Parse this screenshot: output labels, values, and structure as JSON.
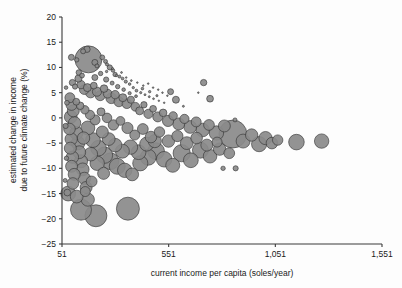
{
  "figure": {
    "name": "bubble-scatter-income-climate",
    "background_color": "#fdfdfd",
    "bubble_fill": "#8a8a8a",
    "bubble_stroke": "#2f2f2f"
  },
  "chart_data": {
    "type": "scatter",
    "title": "",
    "subtitle": "",
    "xlabel": "current income per capita (soles/year)",
    "ylabel": "estimated change in income\ndue to future climate change (%)",
    "ylabel_line1": "estimated change in income",
    "ylabel_line2": "due to future  climate change (%)",
    "xlim": [
      51,
      1551
    ],
    "ylim": [
      -25,
      20
    ],
    "grid": false,
    "legend": null,
    "xticks": [
      51,
      551,
      1051,
      1551
    ],
    "xticklabels": [
      "51",
      "551",
      "1,051",
      "1,551"
    ],
    "yticks": [
      20,
      15,
      10,
      5,
      0,
      -5,
      -10,
      -15,
      -20,
      -25
    ],
    "yticklabels": [
      "20",
      "15",
      "10",
      "5",
      "0",
      "−5",
      "−10",
      "−15",
      "−20",
      "−25"
    ],
    "marker": "circle",
    "size_encoding": "bubble area proportional to population",
    "points": [
      {
        "x": 95,
        "y": 12.0,
        "s": 3.0
      },
      {
        "x": 120,
        "y": 11.5,
        "s": 2.2
      },
      {
        "x": 150,
        "y": 13.2,
        "s": 2.5
      },
      {
        "x": 168,
        "y": 13.6,
        "s": 3.2
      },
      {
        "x": 175,
        "y": 11.6,
        "s": 13.5
      },
      {
        "x": 205,
        "y": 11.0,
        "s": 3.0
      },
      {
        "x": 215,
        "y": 10.3,
        "s": 2.0
      },
      {
        "x": 240,
        "y": 12.0,
        "s": 2.4
      },
      {
        "x": 255,
        "y": 11.2,
        "s": 2.0
      },
      {
        "x": 262,
        "y": 10.6,
        "s": 1.6
      },
      {
        "x": 275,
        "y": 10.0,
        "s": 2.6
      },
      {
        "x": 290,
        "y": 9.4,
        "s": 1.8
      },
      {
        "x": 300,
        "y": 8.6,
        "s": 2.2
      },
      {
        "x": 320,
        "y": 8.2,
        "s": 1.5
      },
      {
        "x": 335,
        "y": 7.8,
        "s": 1.4
      },
      {
        "x": 350,
        "y": 7.2,
        "s": 1.6
      },
      {
        "x": 368,
        "y": 6.7,
        "s": 1.3
      },
      {
        "x": 385,
        "y": 6.0,
        "s": 1.2
      },
      {
        "x": 400,
        "y": 5.4,
        "s": 1.4
      },
      {
        "x": 420,
        "y": 5.0,
        "s": 1.1
      },
      {
        "x": 440,
        "y": 4.6,
        "s": 1.0
      },
      {
        "x": 460,
        "y": 4.2,
        "s": 1.0
      },
      {
        "x": 480,
        "y": 3.8,
        "s": 0.9
      },
      {
        "x": 505,
        "y": 3.4,
        "s": 0.8
      },
      {
        "x": 530,
        "y": 3.0,
        "s": 0.8
      },
      {
        "x": 560,
        "y": 5.2,
        "s": 3.0
      },
      {
        "x": 585,
        "y": 3.6,
        "s": 3.5
      },
      {
        "x": 620,
        "y": 2.3,
        "s": 1.0
      },
      {
        "x": 690,
        "y": 5.0,
        "s": 0.7
      },
      {
        "x": 715,
        "y": 7.0,
        "s": 3.2
      },
      {
        "x": 745,
        "y": 3.8,
        "s": 3.4
      },
      {
        "x": 100,
        "y": 7.0,
        "s": 3.2
      },
      {
        "x": 112,
        "y": 6.2,
        "s": 2.6
      },
      {
        "x": 128,
        "y": 7.8,
        "s": 3.6
      },
      {
        "x": 140,
        "y": 6.6,
        "s": 4.2
      },
      {
        "x": 155,
        "y": 5.6,
        "s": 4.8
      },
      {
        "x": 170,
        "y": 6.0,
        "s": 4.0
      },
      {
        "x": 185,
        "y": 5.0,
        "s": 5.2
      },
      {
        "x": 200,
        "y": 6.4,
        "s": 3.4
      },
      {
        "x": 215,
        "y": 5.2,
        "s": 4.6
      },
      {
        "x": 230,
        "y": 4.4,
        "s": 5.0
      },
      {
        "x": 248,
        "y": 5.8,
        "s": 3.8
      },
      {
        "x": 265,
        "y": 4.8,
        "s": 4.4
      },
      {
        "x": 282,
        "y": 3.9,
        "s": 5.4
      },
      {
        "x": 300,
        "y": 4.6,
        "s": 4.2
      },
      {
        "x": 318,
        "y": 3.2,
        "s": 5.0
      },
      {
        "x": 336,
        "y": 4.0,
        "s": 4.0
      },
      {
        "x": 355,
        "y": 2.8,
        "s": 4.8
      },
      {
        "x": 374,
        "y": 3.6,
        "s": 3.6
      },
      {
        "x": 395,
        "y": 2.2,
        "s": 4.4
      },
      {
        "x": 415,
        "y": 1.4,
        "s": 4.0
      },
      {
        "x": 435,
        "y": 2.6,
        "s": 3.2
      },
      {
        "x": 456,
        "y": 0.8,
        "s": 4.6
      },
      {
        "x": 478,
        "y": 1.8,
        "s": 3.4
      },
      {
        "x": 500,
        "y": 0.2,
        "s": 5.0
      },
      {
        "x": 525,
        "y": 1.0,
        "s": 3.8
      },
      {
        "x": 548,
        "y": -0.6,
        "s": 5.6
      },
      {
        "x": 572,
        "y": 0.4,
        "s": 4.2
      },
      {
        "x": 598,
        "y": -1.2,
        "s": 6.0
      },
      {
        "x": 625,
        "y": -0.2,
        "s": 4.6
      },
      {
        "x": 652,
        "y": -1.8,
        "s": 6.4
      },
      {
        "x": 680,
        "y": -0.8,
        "s": 5.0
      },
      {
        "x": 710,
        "y": -2.4,
        "s": 6.8
      },
      {
        "x": 740,
        "y": -1.4,
        "s": 5.4
      },
      {
        "x": 775,
        "y": -3.0,
        "s": 7.2
      },
      {
        "x": 812,
        "y": -1.6,
        "s": 6.0
      },
      {
        "x": 852,
        "y": -3.2,
        "s": 14.0
      },
      {
        "x": 862,
        "y": -0.4,
        "s": 2.0
      },
      {
        "x": 900,
        "y": -4.6,
        "s": 7.0
      },
      {
        "x": 940,
        "y": -3.4,
        "s": 6.2
      },
      {
        "x": 975,
        "y": -5.2,
        "s": 7.6
      },
      {
        "x": 1005,
        "y": -4.0,
        "s": 6.6
      },
      {
        "x": 1035,
        "y": -5.0,
        "s": 5.8
      },
      {
        "x": 1062,
        "y": -4.4,
        "s": 5.2
      },
      {
        "x": 1150,
        "y": -4.8,
        "s": 7.8
      },
      {
        "x": 1268,
        "y": -4.6,
        "s": 7.2
      },
      {
        "x": 88,
        "y": 4.0,
        "s": 5.0
      },
      {
        "x": 96,
        "y": 2.6,
        "s": 5.6
      },
      {
        "x": 104,
        "y": 1.4,
        "s": 6.0
      },
      {
        "x": 92,
        "y": 0.2,
        "s": 6.4
      },
      {
        "x": 110,
        "y": -1.0,
        "s": 6.2
      },
      {
        "x": 86,
        "y": -2.2,
        "s": 5.8
      },
      {
        "x": 118,
        "y": -3.0,
        "s": 6.6
      },
      {
        "x": 94,
        "y": -4.2,
        "s": 6.2
      },
      {
        "x": 126,
        "y": -5.0,
        "s": 6.8
      },
      {
        "x": 90,
        "y": -6.0,
        "s": 6.0
      },
      {
        "x": 132,
        "y": -6.8,
        "s": 6.4
      },
      {
        "x": 100,
        "y": -7.8,
        "s": 6.2
      },
      {
        "x": 140,
        "y": -8.6,
        "s": 6.6
      },
      {
        "x": 96,
        "y": -9.6,
        "s": 6.0
      },
      {
        "x": 148,
        "y": -10.2,
        "s": 6.4
      },
      {
        "x": 108,
        "y": -11.2,
        "s": 6.0
      },
      {
        "x": 156,
        "y": -12.0,
        "s": 6.2
      },
      {
        "x": 102,
        "y": -13.0,
        "s": 5.8
      },
      {
        "x": 164,
        "y": -13.8,
        "s": 6.0
      },
      {
        "x": 80,
        "y": -15.0,
        "s": 7.4
      },
      {
        "x": 120,
        "y": -15.6,
        "s": 6.4
      },
      {
        "x": 172,
        "y": -16.2,
        "s": 6.6
      },
      {
        "x": 140,
        "y": -18.2,
        "s": 10.5
      },
      {
        "x": 210,
        "y": -19.4,
        "s": 11.0
      },
      {
        "x": 360,
        "y": -18.0,
        "s": 11.5
      },
      {
        "x": 172,
        "y": -2.0,
        "s": 7.0
      },
      {
        "x": 196,
        "y": -4.4,
        "s": 7.4
      },
      {
        "x": 222,
        "y": -6.0,
        "s": 7.8
      },
      {
        "x": 250,
        "y": -7.4,
        "s": 8.2
      },
      {
        "x": 278,
        "y": -8.6,
        "s": 8.4
      },
      {
        "x": 310,
        "y": -9.6,
        "s": 8.0
      },
      {
        "x": 345,
        "y": -10.4,
        "s": 7.2
      },
      {
        "x": 380,
        "y": -11.2,
        "s": 6.4
      },
      {
        "x": 418,
        "y": -9.0,
        "s": 7.6
      },
      {
        "x": 455,
        "y": -7.8,
        "s": 8.0
      },
      {
        "x": 492,
        "y": -6.6,
        "s": 8.4
      },
      {
        "x": 530,
        "y": -8.2,
        "s": 7.8
      },
      {
        "x": 570,
        "y": -9.4,
        "s": 7.0
      },
      {
        "x": 612,
        "y": -7.0,
        "s": 8.6
      },
      {
        "x": 655,
        "y": -8.4,
        "s": 7.4
      },
      {
        "x": 700,
        "y": -6.4,
        "s": 8.0
      },
      {
        "x": 745,
        "y": -7.6,
        "s": 6.8
      },
      {
        "x": 790,
        "y": -6.2,
        "s": 6.2
      },
      {
        "x": 835,
        "y": -7.0,
        "s": 5.4
      },
      {
        "x": 806,
        "y": -10.0,
        "s": 2.2
      },
      {
        "x": 865,
        "y": -10.0,
        "s": 2.6
      },
      {
        "x": 130,
        "y": 9.0,
        "s": 2.8
      },
      {
        "x": 145,
        "y": 8.4,
        "s": 2.4
      },
      {
        "x": 205,
        "y": 8.0,
        "s": 3.0
      },
      {
        "x": 232,
        "y": 8.8,
        "s": 2.2
      },
      {
        "x": 258,
        "y": 7.6,
        "s": 2.6
      },
      {
        "x": 286,
        "y": 6.9,
        "s": 2.0
      },
      {
        "x": 312,
        "y": 6.2,
        "s": 2.2
      },
      {
        "x": 340,
        "y": 5.6,
        "s": 1.8
      },
      {
        "x": 368,
        "y": 4.9,
        "s": 1.6
      },
      {
        "x": 398,
        "y": 4.3,
        "s": 1.4
      },
      {
        "x": 428,
        "y": 5.8,
        "s": 1.3
      },
      {
        "x": 462,
        "y": 5.2,
        "s": 1.2
      },
      {
        "x": 496,
        "y": 4.4,
        "s": 1.1
      },
      {
        "x": 118,
        "y": 3.2,
        "s": 3.4
      },
      {
        "x": 136,
        "y": 2.4,
        "s": 3.8
      },
      {
        "x": 158,
        "y": 1.6,
        "s": 4.2
      },
      {
        "x": 182,
        "y": 0.6,
        "s": 4.6
      },
      {
        "x": 206,
        "y": -0.4,
        "s": 5.0
      },
      {
        "x": 234,
        "y": 1.2,
        "s": 4.0
      },
      {
        "x": 262,
        "y": 0.0,
        "s": 4.8
      },
      {
        "x": 292,
        "y": -1.4,
        "s": 5.2
      },
      {
        "x": 325,
        "y": -0.6,
        "s": 4.4
      },
      {
        "x": 358,
        "y": -2.0,
        "s": 5.6
      },
      {
        "x": 392,
        "y": -3.4,
        "s": 5.0
      },
      {
        "x": 430,
        "y": -2.2,
        "s": 5.4
      },
      {
        "x": 468,
        "y": -3.8,
        "s": 5.8
      },
      {
        "x": 508,
        "y": -2.8,
        "s": 5.2
      },
      {
        "x": 550,
        "y": -4.6,
        "s": 6.2
      },
      {
        "x": 592,
        "y": -3.6,
        "s": 5.6
      },
      {
        "x": 636,
        "y": -5.0,
        "s": 6.4
      },
      {
        "x": 682,
        "y": -4.0,
        "s": 5.8
      },
      {
        "x": 730,
        "y": -5.4,
        "s": 6.0
      },
      {
        "x": 778,
        "y": -4.8,
        "s": 5.0
      },
      {
        "x": 70,
        "y": 6.0,
        "s": 1.8
      },
      {
        "x": 74,
        "y": 3.0,
        "s": 2.4
      },
      {
        "x": 68,
        "y": -1.6,
        "s": 2.6
      },
      {
        "x": 72,
        "y": -8.0,
        "s": 2.2
      },
      {
        "x": 66,
        "y": -12.4,
        "s": 2.0
      },
      {
        "x": 76,
        "y": -14.8,
        "s": 3.4
      },
      {
        "x": 260,
        "y": 9.2,
        "s": 1.2
      },
      {
        "x": 288,
        "y": 9.8,
        "s": 1.0
      },
      {
        "x": 306,
        "y": 8.4,
        "s": 1.1
      },
      {
        "x": 330,
        "y": 9.0,
        "s": 0.9
      },
      {
        "x": 352,
        "y": 8.0,
        "s": 0.8
      },
      {
        "x": 376,
        "y": 7.4,
        "s": 0.9
      },
      {
        "x": 404,
        "y": 7.0,
        "s": 0.8
      },
      {
        "x": 432,
        "y": 6.4,
        "s": 0.7
      },
      {
        "x": 455,
        "y": 6.8,
        "s": 0.7
      },
      {
        "x": 478,
        "y": 6.0,
        "s": 0.6
      },
      {
        "x": 502,
        "y": 5.6,
        "s": 0.6
      },
      {
        "x": 522,
        "y": 5.0,
        "s": 0.5
      },
      {
        "x": 545,
        "y": 4.4,
        "s": 0.5
      },
      {
        "x": 240,
        "y": -2.8,
        "s": 6.0
      },
      {
        "x": 270,
        "y": -4.2,
        "s": 6.4
      },
      {
        "x": 300,
        "y": -5.4,
        "s": 6.8
      },
      {
        "x": 334,
        "y": -6.6,
        "s": 7.0
      },
      {
        "x": 372,
        "y": -5.8,
        "s": 7.2
      },
      {
        "x": 410,
        "y": -6.8,
        "s": 7.4
      },
      {
        "x": 448,
        "y": -5.2,
        "s": 7.0
      },
      {
        "x": 486,
        "y": -4.6,
        "s": 6.6
      },
      {
        "x": 152,
        "y": -4.0,
        "s": 6.2
      },
      {
        "x": 186,
        "y": -7.2,
        "s": 6.8
      },
      {
        "x": 216,
        "y": -9.0,
        "s": 7.2
      },
      {
        "x": 246,
        "y": -11.0,
        "s": 6.0
      },
      {
        "x": 190,
        "y": -12.6,
        "s": 5.4
      },
      {
        "x": 160,
        "y": -14.6,
        "s": 5.0
      }
    ]
  }
}
